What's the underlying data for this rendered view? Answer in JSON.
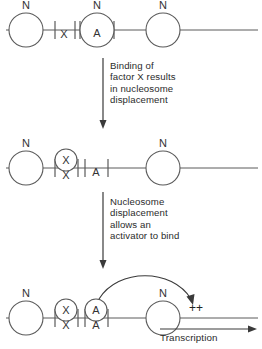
{
  "figure": {
    "line_color": "#5a5a5a",
    "arrow_color": "#3a3a3a",
    "background": "#ffffff"
  },
  "labels": {
    "nucleosome": "N",
    "factor_x": "X",
    "activator": "A",
    "plus_plus": "++",
    "transcription": "Transcription"
  },
  "captions": {
    "step1": "Binding of\nfactor X results\nin nucleosome\ndisplacement",
    "step2": "Nucleosome\ndisplacement\nallows an\nactivator to bind"
  },
  "rows": [
    {
      "id": "row-1",
      "baseline_y": 30,
      "nucleosomes": [
        {
          "cx": 26,
          "r": 17,
          "label": "N"
        },
        {
          "cx": 97,
          "r": 17,
          "label": "N",
          "inner_label": "A"
        },
        {
          "cx": 163,
          "r": 17,
          "label": "N"
        }
      ],
      "site_labels": [
        {
          "x": 64,
          "text": "X",
          "position": "on-line"
        }
      ],
      "ticks": [
        {
          "x": 55
        },
        {
          "x": 75
        },
        {
          "x": 80
        },
        {
          "x": 114
        }
      ]
    },
    {
      "id": "row-2",
      "baseline_y": 168,
      "nucleosomes": [
        {
          "cx": 26,
          "r": 17,
          "label": "N"
        },
        {
          "cx": 163,
          "r": 17,
          "label": "N"
        }
      ],
      "bound_factors": [
        {
          "cx": 66,
          "r": 11,
          "label": "X",
          "below_label": "X"
        }
      ],
      "site_labels": [
        {
          "x": 96,
          "text": "A",
          "position": "on-line"
        }
      ],
      "ticks": [
        {
          "x": 55
        },
        {
          "x": 78
        },
        {
          "x": 85
        },
        {
          "x": 108
        }
      ]
    },
    {
      "id": "row-3",
      "baseline_y": 318,
      "nucleosomes": [
        {
          "cx": 26,
          "r": 17,
          "label": "N"
        },
        {
          "cx": 163,
          "r": 17,
          "label": "N"
        }
      ],
      "bound_factors": [
        {
          "cx": 66,
          "r": 11,
          "label": "X",
          "below_label": "X"
        },
        {
          "cx": 96,
          "r": 11,
          "label": "A",
          "below_label": "A"
        }
      ],
      "ticks": [
        {
          "x": 55
        },
        {
          "x": 78
        },
        {
          "x": 85
        },
        {
          "x": 108
        }
      ],
      "activation": {
        "from_x": 96,
        "to_x": 193,
        "plus_x": 196,
        "plus_y": 310
      },
      "transcription_arrow": {
        "x1": 160,
        "x2": 256,
        "y": 329
      }
    }
  ],
  "step_arrows": [
    {
      "id": "step-arrow-1",
      "x": 103,
      "y1": 58,
      "y2": 128
    },
    {
      "id": "step-arrow-2",
      "x": 103,
      "y1": 192,
      "y2": 268
    }
  ]
}
